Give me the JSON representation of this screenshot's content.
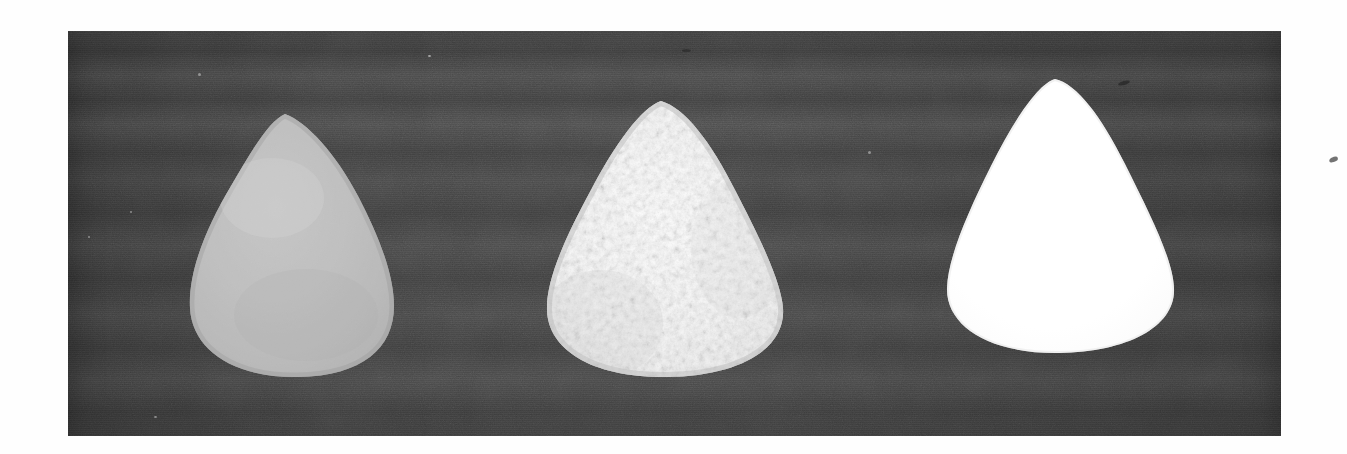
{
  "figure": {
    "kind": "scanned-grayscale-photograph",
    "caption": "",
    "page_background": "#fefefe",
    "plate": {
      "name": "photographic-plate",
      "background_color": "#3b3b3b",
      "x": 68,
      "y": 31,
      "width": 1213,
      "height": 405,
      "texture": "film-grain with horizontal scan banding"
    },
    "specimens": [
      {
        "id": "specimen-left",
        "position_label": "left",
        "description": "smooth matte grey teardrop-shaped object",
        "surface": "smooth",
        "fill_color": "#b9b9b9",
        "highlight_color": "#cfcfcf",
        "shadow_color": "#9d9d9d",
        "x": 186,
        "y": 110,
        "width": 212,
        "height": 270
      },
      {
        "id": "specimen-middle",
        "position_label": "middle",
        "description": "rough granular crystalline white teardrop-shaped object",
        "surface": "rough-granular",
        "fill_color": "#eeeeee",
        "highlight_color": "#ffffff",
        "shadow_color": "#c6c6c6",
        "x": 543,
        "y": 98,
        "width": 246,
        "height": 282
      },
      {
        "id": "specimen-right",
        "position_label": "right",
        "description": "smooth bright white teardrop-shaped object",
        "surface": "smooth-glossy",
        "fill_color": "#ffffff",
        "highlight_color": "#ffffff",
        "shadow_color": "#f2f2f2",
        "x": 943,
        "y": 76,
        "width": 236,
        "height": 280
      }
    ],
    "artifacts": [
      {
        "id": "margin-speck",
        "description": "small dark ink speck in the right paper margin",
        "color": "#5b5b5b",
        "x": 1329,
        "y": 157
      }
    ]
  }
}
